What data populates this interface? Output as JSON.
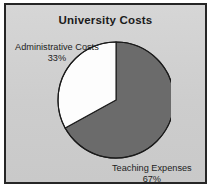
{
  "chart_data": {
    "type": "pie",
    "title": "University Costs",
    "categories": [
      "Teaching Expenses",
      "Administrative Costs"
    ],
    "values": [
      67,
      33
    ],
    "value_unit": "%",
    "labels": [
      {
        "name": "Administrative Costs",
        "value": 33,
        "value_text": "33%",
        "color": "#fdfdfd",
        "position": "upper-left"
      },
      {
        "name": "Teaching Expenses",
        "value": 67,
        "value_text": "67%",
        "color": "#6b6b6b",
        "position": "lower-right"
      }
    ],
    "legend": "none",
    "grid": false,
    "start_angle_deg": 0,
    "direction": "counter-clockwise-white-slice",
    "colors": {
      "teaching": "#6b6b6b",
      "administrative": "#fdfdfd",
      "outline": "#1b1b1b",
      "panel_background": "#d2d2d2",
      "frame_border": "#262626",
      "text": "#1b1b1b"
    }
  },
  "chart": {
    "title": "University Costs",
    "slices": {
      "administrative": {
        "label": "Administrative Costs",
        "percent": "33%"
      },
      "teaching": {
        "label": "Teaching Expenses",
        "percent": "67%"
      }
    }
  }
}
